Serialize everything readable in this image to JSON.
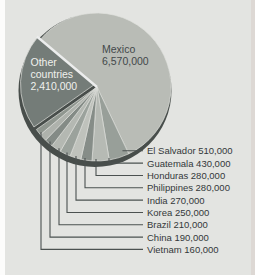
{
  "figure": {
    "background": "#e3e4e1",
    "left_margin_color": "#fcfcfb",
    "right_edge_color": "#ddd8d4"
  },
  "chart_data": {
    "type": "pie",
    "title": "",
    "categories": [
      "Mexico",
      "El Salvador",
      "Guatemala",
      "Honduras",
      "Philippines",
      "India",
      "Korea",
      "Brazil",
      "China",
      "Vietnam",
      "Other countries"
    ],
    "values": [
      6570000,
      510000,
      430000,
      280000,
      280000,
      270000,
      250000,
      210000,
      190000,
      160000,
      2410000
    ],
    "total": 11560000,
    "start_angle_deg": 220,
    "legend_position": "right-callouts",
    "slices": [
      {
        "label": "Mexico",
        "value": 6570000,
        "display": "6,570,000",
        "color": "#b9bcb6",
        "callout": false,
        "exploded": false
      },
      {
        "label": "El Salvador",
        "value": 510000,
        "display": "510,000",
        "color": "#989f99",
        "callout": true,
        "exploded": false
      },
      {
        "label": "Guatemala",
        "value": 430000,
        "display": "430,000",
        "color": "#b6bab4",
        "callout": true,
        "exploded": false
      },
      {
        "label": "Honduras",
        "value": 280000,
        "display": "280,000",
        "color": "#868d88",
        "callout": true,
        "exploded": false
      },
      {
        "label": "Philippines",
        "value": 280000,
        "display": "280,000",
        "color": "#bfc2bc",
        "callout": true,
        "exploded": false
      },
      {
        "label": "India",
        "value": 270000,
        "display": "270,000",
        "color": "#9ba29c",
        "callout": true,
        "exploded": false
      },
      {
        "label": "Korea",
        "value": 250000,
        "display": "250,000",
        "color": "#b4b8b2",
        "callout": true,
        "exploded": false
      },
      {
        "label": "Brazil",
        "value": 210000,
        "display": "210,000",
        "color": "#848b86",
        "callout": true,
        "exploded": false
      },
      {
        "label": "China",
        "value": 190000,
        "display": "190,000",
        "color": "#aeb2ac",
        "callout": true,
        "exploded": false
      },
      {
        "label": "Vietnam",
        "value": 160000,
        "display": "160,000",
        "color": "#8f968f",
        "callout": true,
        "exploded": false
      },
      {
        "label": "Other countries",
        "label_lines": [
          "Other",
          "countries"
        ],
        "value": 2410000,
        "display": "2,410,000",
        "color": "#747c78",
        "callout": false,
        "exploded": true
      }
    ],
    "colors": {
      "background": "#e3e4e1",
      "rim_shadow": "#484e4b",
      "leader_line": "#4b5150",
      "slice_edge": "#dfe1dc",
      "separator": "#eceded",
      "callout_text": "#33383a",
      "inside_text_dark": "#43484a",
      "inside_text_light": "#f0f1ed"
    }
  }
}
